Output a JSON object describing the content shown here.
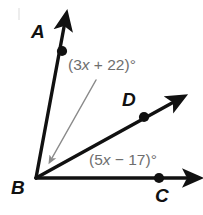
{
  "figure": {
    "background_color": "#ffffff",
    "stroke_color": "#111111",
    "annotation_color": "#6e6e6e"
  },
  "points": {
    "A": {
      "label": "A"
    },
    "B": {
      "label": "B"
    },
    "C": {
      "label": "C"
    },
    "D": {
      "label": "D"
    }
  },
  "angles": {
    "abd": {
      "open_paren": "(",
      "coefficient": "3",
      "variable": "x",
      "operator": " + ",
      "constant": "22",
      "close_paren": ")",
      "degree": "°",
      "full": "(3x + 22)°"
    },
    "dbc": {
      "open_paren": "(",
      "coefficient": "5",
      "variable": "x",
      "operator": " − ",
      "constant": "17",
      "close_paren": ")",
      "degree": "°",
      "full": "(5x − 17)°"
    }
  }
}
